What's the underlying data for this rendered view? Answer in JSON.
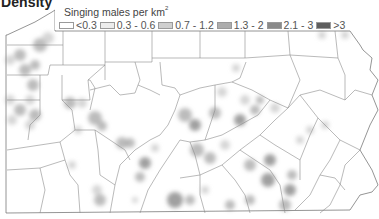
{
  "title": "Density",
  "legend": {
    "title": "Singing males per km",
    "title_superscript": "2",
    "items": [
      {
        "label": "<0.3",
        "color": "#ffffff"
      },
      {
        "label": "0.3 - 0.6",
        "color": "#ececec"
      },
      {
        "label": "0.7 - 1.2",
        "color": "#cfcfcf"
      },
      {
        "label": "1.3 - 2",
        "color": "#adadad"
      },
      {
        "label": "2.1 - 3",
        "color": "#8a8a8a"
      },
      {
        "label": ">3",
        "color": "#5e5e5e"
      }
    ]
  },
  "map": {
    "region": "Pennsylvania counties",
    "outline_color": "#8c8c8c",
    "density_blobs": [
      {
        "x": 20,
        "y": 55,
        "r": 6,
        "level": 3
      },
      {
        "x": 40,
        "y": 45,
        "r": 7,
        "level": 3
      },
      {
        "x": 48,
        "y": 38,
        "r": 6,
        "level": 2
      },
      {
        "x": 10,
        "y": 60,
        "r": 5,
        "level": 2
      },
      {
        "x": 25,
        "y": 70,
        "r": 6,
        "level": 3
      },
      {
        "x": 35,
        "y": 65,
        "r": 5,
        "level": 3
      },
      {
        "x": 33,
        "y": 85,
        "r": 6,
        "level": 3
      },
      {
        "x": 30,
        "y": 100,
        "r": 5,
        "level": 2
      },
      {
        "x": 10,
        "y": 100,
        "r": 5,
        "level": 2
      },
      {
        "x": 20,
        "y": 110,
        "r": 6,
        "level": 3
      },
      {
        "x": 35,
        "y": 115,
        "r": 6,
        "level": 3
      },
      {
        "x": 30,
        "y": 125,
        "r": 5,
        "level": 2
      },
      {
        "x": 12,
        "y": 120,
        "r": 5,
        "level": 2
      },
      {
        "x": 70,
        "y": 103,
        "r": 6,
        "level": 3
      },
      {
        "x": 82,
        "y": 103,
        "r": 5,
        "level": 2
      },
      {
        "x": 95,
        "y": 118,
        "r": 7,
        "level": 3
      },
      {
        "x": 102,
        "y": 126,
        "r": 5,
        "level": 3
      },
      {
        "x": 78,
        "y": 130,
        "r": 4,
        "level": 2
      },
      {
        "x": 72,
        "y": 165,
        "r": 4,
        "level": 2
      },
      {
        "x": 97,
        "y": 190,
        "r": 5,
        "level": 2
      },
      {
        "x": 100,
        "y": 200,
        "r": 6,
        "level": 3
      },
      {
        "x": 122,
        "y": 143,
        "r": 6,
        "level": 3
      },
      {
        "x": 130,
        "y": 143,
        "r": 5,
        "level": 3
      },
      {
        "x": 145,
        "y": 163,
        "r": 6,
        "level": 4
      },
      {
        "x": 140,
        "y": 177,
        "r": 5,
        "level": 3
      },
      {
        "x": 175,
        "y": 200,
        "r": 8,
        "level": 4
      },
      {
        "x": 190,
        "y": 200,
        "r": 5,
        "level": 3
      },
      {
        "x": 135,
        "y": 200,
        "r": 3,
        "level": 2
      },
      {
        "x": 155,
        "y": 148,
        "r": 4,
        "level": 2
      },
      {
        "x": 185,
        "y": 115,
        "r": 7,
        "level": 3
      },
      {
        "x": 195,
        "y": 125,
        "r": 6,
        "level": 4
      },
      {
        "x": 215,
        "y": 113,
        "r": 6,
        "level": 3
      },
      {
        "x": 240,
        "y": 120,
        "r": 6,
        "level": 4
      },
      {
        "x": 255,
        "y": 110,
        "r": 5,
        "level": 3
      },
      {
        "x": 222,
        "y": 92,
        "r": 5,
        "level": 2
      },
      {
        "x": 245,
        "y": 100,
        "r": 5,
        "level": 2
      },
      {
        "x": 260,
        "y": 100,
        "r": 4,
        "level": 3
      },
      {
        "x": 275,
        "y": 108,
        "r": 5,
        "level": 2
      },
      {
        "x": 197,
        "y": 150,
        "r": 7,
        "level": 3
      },
      {
        "x": 210,
        "y": 158,
        "r": 6,
        "level": 3
      },
      {
        "x": 225,
        "y": 145,
        "r": 5,
        "level": 2
      },
      {
        "x": 250,
        "y": 165,
        "r": 6,
        "level": 3
      },
      {
        "x": 270,
        "y": 160,
        "r": 6,
        "level": 4
      },
      {
        "x": 268,
        "y": 180,
        "r": 7,
        "level": 4
      },
      {
        "x": 290,
        "y": 190,
        "r": 6,
        "level": 4
      },
      {
        "x": 292,
        "y": 175,
        "r": 5,
        "level": 3
      },
      {
        "x": 285,
        "y": 205,
        "r": 6,
        "level": 3
      },
      {
        "x": 250,
        "y": 200,
        "r": 5,
        "level": 3
      },
      {
        "x": 230,
        "y": 205,
        "r": 5,
        "level": 3
      },
      {
        "x": 205,
        "y": 190,
        "r": 4,
        "level": 2
      },
      {
        "x": 300,
        "y": 140,
        "r": 4,
        "level": 2
      },
      {
        "x": 310,
        "y": 130,
        "r": 4,
        "level": 2
      },
      {
        "x": 325,
        "y": 125,
        "r": 4,
        "level": 2
      },
      {
        "x": 322,
        "y": 35,
        "r": 4,
        "level": 2
      },
      {
        "x": 345,
        "y": 35,
        "r": 4,
        "level": 2
      },
      {
        "x": 236,
        "y": 68,
        "r": 4,
        "level": 2
      }
    ]
  }
}
